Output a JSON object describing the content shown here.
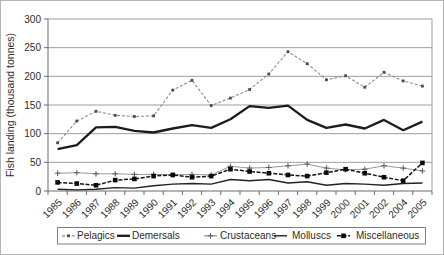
{
  "figure": {
    "background": "#ffffff",
    "border_color": "#b5b5b5",
    "text_color": "#2d2d2d",
    "grid_color": "#9e9e9e",
    "axis_color": "#6b6b6b",
    "legend_border_color": "#7f7f7f"
  },
  "y_axis": {
    "title": "Fish landing (thousand tonnes)",
    "ticks": [
      0,
      50,
      100,
      150,
      200,
      250,
      300
    ]
  },
  "legend": {
    "items": [
      {
        "label": "Pelagics"
      },
      {
        "label": "Demersals"
      },
      {
        "label": "Crustaceans"
      },
      {
        "label": "Molluscs"
      },
      {
        "label": "Miscellaneous"
      }
    ]
  },
  "chart_data": {
    "type": "line",
    "title": "",
    "xlabel": "",
    "ylabel": "Fish landing (thousand tonnes)",
    "ylim": [
      0,
      300
    ],
    "grid": true,
    "legend_position": "bottom",
    "categories": [
      "1985",
      "1986",
      "1987",
      "1988",
      "1989",
      "1990",
      "1991",
      "1992",
      "1993",
      "1994",
      "1995",
      "1996",
      "1997",
      "1998",
      "1999",
      "2000",
      "2001",
      "2002",
      "2004",
      "2005"
    ],
    "series": [
      {
        "name": "Pelagics",
        "values": [
          84,
          122,
          139,
          132,
          130,
          131,
          176,
          193,
          149,
          162,
          177,
          204,
          243,
          222,
          194,
          201,
          181,
          207,
          192,
          183
        ],
        "color": "#8c8c8c",
        "marker_color": "#4a4a4a",
        "line_width": 1.1,
        "dash": "3,1.8",
        "marker": "square-small"
      },
      {
        "name": "Demersals",
        "values": [
          73,
          80,
          111,
          112,
          105,
          102,
          109,
          115,
          110,
          125,
          148,
          145,
          149,
          124,
          110,
          116,
          109,
          124,
          106,
          121
        ],
        "color": "#1c1c1c",
        "marker_color": "#1c1c1c",
        "line_width": 2.3,
        "dash": "",
        "marker": "none"
      },
      {
        "name": "Crustaceans",
        "values": [
          31,
          32,
          30,
          30,
          29,
          29,
          28,
          29,
          28,
          43,
          40,
          41,
          44,
          47,
          40,
          37,
          38,
          44,
          40,
          35
        ],
        "color": "#999999",
        "marker_color": "#5a5a5a",
        "line_width": 1,
        "dash": "",
        "marker": "plus"
      },
      {
        "name": "Molluscs",
        "values": [
          3,
          2,
          3,
          6,
          5,
          9,
          12,
          13,
          12,
          20,
          18,
          20,
          14,
          16,
          10,
          13,
          12,
          10,
          13,
          14
        ],
        "color": "#222222",
        "marker_color": "#222222",
        "line_width": 1.4,
        "dash": "",
        "marker": "none"
      },
      {
        "name": "Miscellaneous",
        "values": [
          15,
          13,
          10,
          19,
          21,
          26,
          28,
          24,
          26,
          38,
          34,
          31,
          28,
          26,
          32,
          38,
          31,
          24,
          18,
          49
        ],
        "color": "#141414",
        "marker_color": "#0a0a0a",
        "line_width": 1.5,
        "dash": "4,1.6",
        "marker": "square"
      }
    ]
  }
}
